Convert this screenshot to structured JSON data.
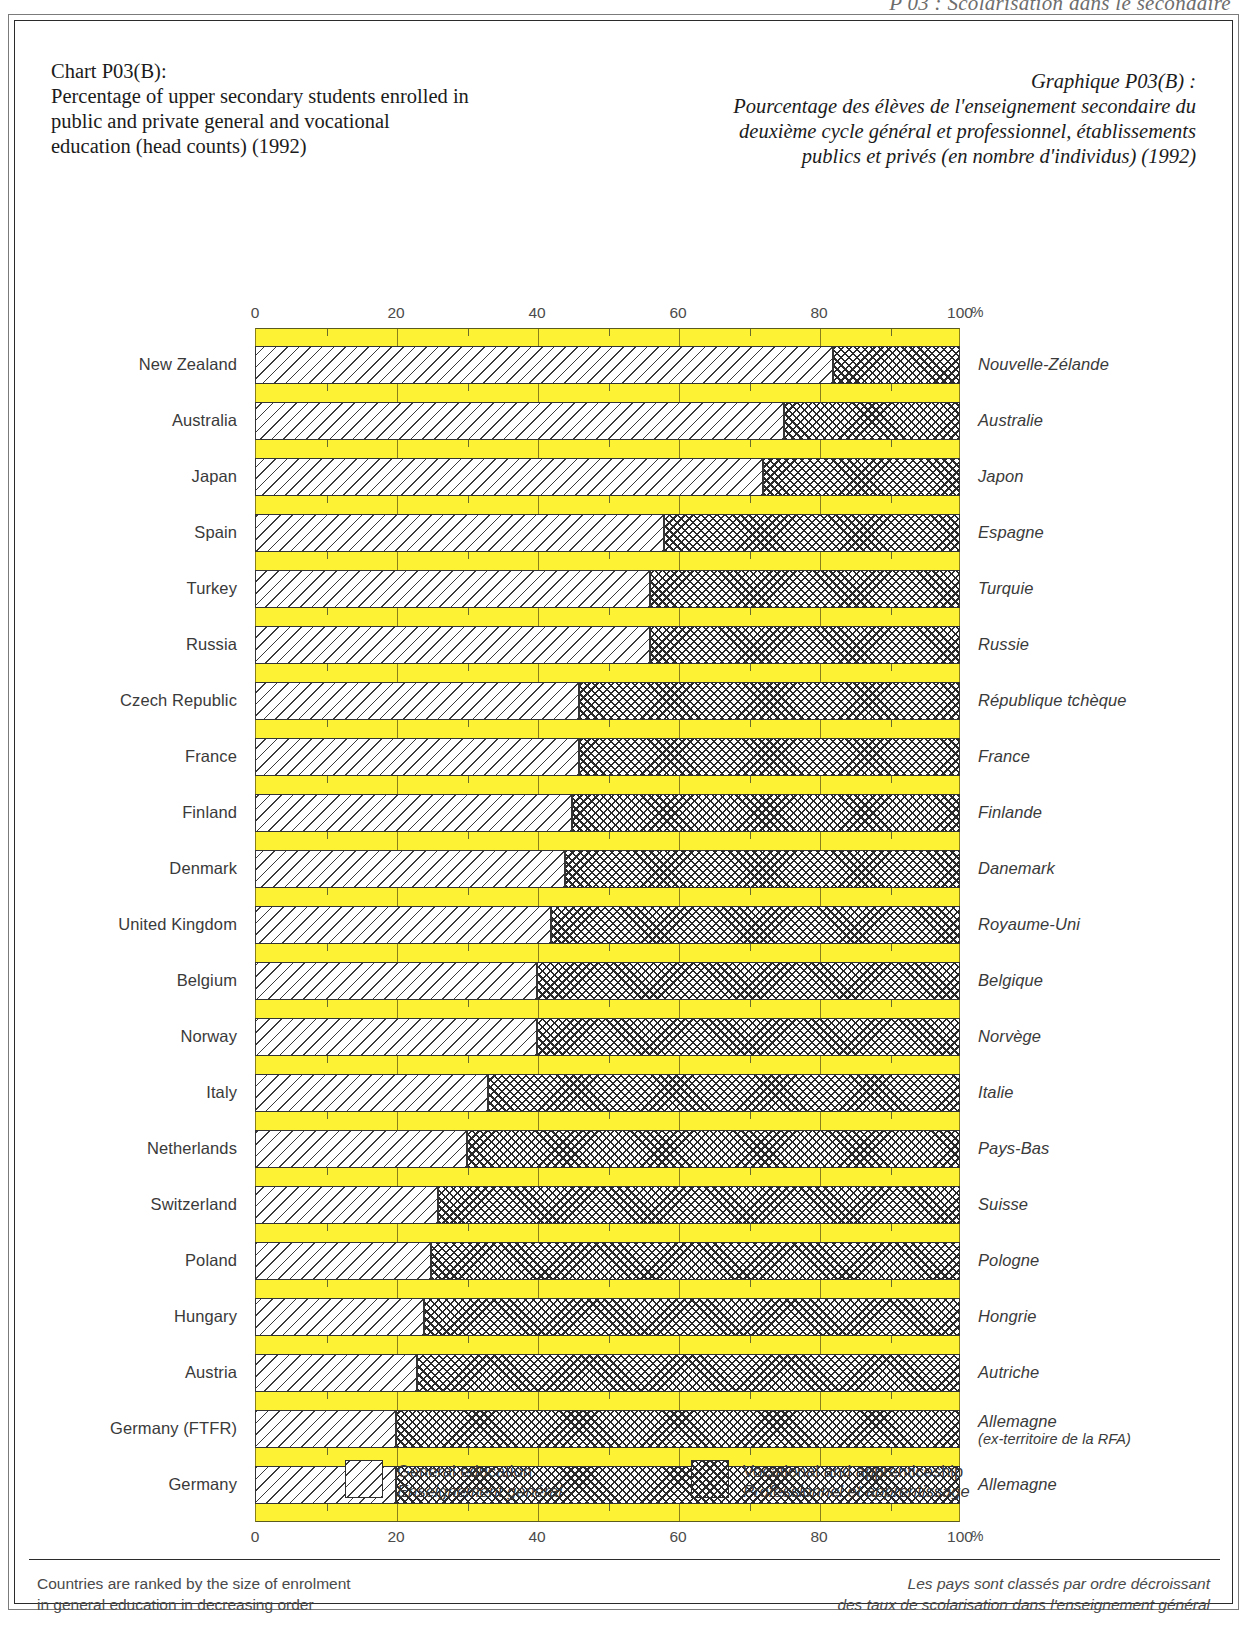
{
  "running_head": "P 03 : Scolarisation dans le secondaire",
  "title_en": "Chart P03(B):\nPercentage of upper secondary students enrolled in public and private general and vocational education (head counts) (1992)",
  "title_fr": "Graphique P03(B) :\nPourcentage des élèves de l'enseignement secondaire du deuxième cycle général et professionnel, établissements publics et privés (en nombre d'individus) (1992)",
  "axis": {
    "percent_symbol": "%",
    "ticks": [
      "0",
      "20",
      "40",
      "60",
      "80",
      "100"
    ]
  },
  "legend": {
    "general": {
      "label_en": "General education",
      "label_fr": "Enseignement général",
      "pattern": "diagonal-hatch"
    },
    "vocational": {
      "label_en": "Vocational and apprenticeship",
      "label_fr": "Professionnel et apprentissage",
      "pattern": "cross-hatch"
    }
  },
  "notes": {
    "en": "Countries are ranked by the size of enrolment\nin general education in decreasing order",
    "fr": "Les pays sont classés par ordre décroissant\ndes taux de scolarisation dans l'enseignement général"
  },
  "colors": {
    "band": "#FDF334",
    "band_border": "#8A7F18",
    "ink": "#3A3A3A"
  },
  "chart_data": {
    "type": "bar",
    "orientation": "horizontal",
    "stacked": true,
    "title_fr": "Graphique P03(B) : Pourcentage des élèves de l'enseignement secondaire du deuxième cycle général et professionnel, établissements publics et privés (en nombre d'individus) (1992)",
    "xlabel": "%",
    "ylabel": "",
    "xlim": [
      0,
      100
    ],
    "xticks": [
      0,
      20,
      40,
      60,
      80,
      100
    ],
    "grid": false,
    "legend_position": "bottom",
    "series": [
      {
        "name": "General education",
        "name_fr": "Enseignement général",
        "values": [
          82,
          75,
          72,
          58,
          56,
          56,
          46,
          46,
          45,
          44,
          42,
          40,
          40,
          33,
          30,
          26,
          25,
          24,
          23,
          20,
          20
        ]
      },
      {
        "name": "Vocational and apprenticeship",
        "name_fr": "Professionnel et apprentissage",
        "values": [
          18,
          25,
          28,
          42,
          44,
          44,
          54,
          54,
          55,
          56,
          58,
          60,
          60,
          67,
          70,
          74,
          75,
          76,
          77,
          80,
          80
        ]
      }
    ],
    "categories": [
      "New Zealand",
      "Australia",
      "Japan",
      "Spain",
      "Turkey",
      "Russia",
      "Czech Republic",
      "France",
      "Finland",
      "Denmark",
      "United Kingdom",
      "Belgium",
      "Norway",
      "Italy",
      "Netherlands",
      "Switzerland",
      "Poland",
      "Hungary",
      "Austria",
      "Germany (FTFR)",
      "Germany"
    ],
    "categories_fr": [
      "Nouvelle-Zélande",
      "Australie",
      "Japon",
      "Espagne",
      "Turquie",
      "Russie",
      "République tchèque",
      "France",
      "Finlande",
      "Danemark",
      "Royaume-Uni",
      "Belgique",
      "Norvège",
      "Italie",
      "Pays-Bas",
      "Suisse",
      "Pologne",
      "Hongrie",
      "Autriche",
      "Allemagne",
      "Allemagne"
    ]
  },
  "rows": [
    {
      "en": "New Zealand",
      "fr": "Nouvelle-Zélande",
      "fr_sub": "",
      "general": 82,
      "vocational": 18
    },
    {
      "en": "Australia",
      "fr": "Australie",
      "fr_sub": "",
      "general": 75,
      "vocational": 25
    },
    {
      "en": "Japan",
      "fr": "Japon",
      "fr_sub": "",
      "general": 72,
      "vocational": 28
    },
    {
      "en": "Spain",
      "fr": "Espagne",
      "fr_sub": "",
      "general": 58,
      "vocational": 42
    },
    {
      "en": "Turkey",
      "fr": "Turquie",
      "fr_sub": "",
      "general": 56,
      "vocational": 44
    },
    {
      "en": "Russia",
      "fr": "Russie",
      "fr_sub": "",
      "general": 56,
      "vocational": 44
    },
    {
      "en": "Czech Republic",
      "fr": "République tchèque",
      "fr_sub": "",
      "general": 46,
      "vocational": 54
    },
    {
      "en": "France",
      "fr": "France",
      "fr_sub": "",
      "general": 46,
      "vocational": 54
    },
    {
      "en": "Finland",
      "fr": "Finlande",
      "fr_sub": "",
      "general": 45,
      "vocational": 55
    },
    {
      "en": "Denmark",
      "fr": "Danemark",
      "fr_sub": "",
      "general": 44,
      "vocational": 56
    },
    {
      "en": "United Kingdom",
      "fr": "Royaume-Uni",
      "fr_sub": "",
      "general": 42,
      "vocational": 58
    },
    {
      "en": "Belgium",
      "fr": "Belgique",
      "fr_sub": "",
      "general": 40,
      "vocational": 60
    },
    {
      "en": "Norway",
      "fr": "Norvège",
      "fr_sub": "",
      "general": 40,
      "vocational": 60
    },
    {
      "en": "Italy",
      "fr": "Italie",
      "fr_sub": "",
      "general": 33,
      "vocational": 67
    },
    {
      "en": "Netherlands",
      "fr": "Pays-Bas",
      "fr_sub": "",
      "general": 30,
      "vocational": 70
    },
    {
      "en": "Switzerland",
      "fr": "Suisse",
      "fr_sub": "",
      "general": 26,
      "vocational": 74
    },
    {
      "en": "Poland",
      "fr": "Pologne",
      "fr_sub": "",
      "general": 25,
      "vocational": 75
    },
    {
      "en": "Hungary",
      "fr": "Hongrie",
      "fr_sub": "",
      "general": 24,
      "vocational": 76
    },
    {
      "en": "Austria",
      "fr": "Autriche",
      "fr_sub": "",
      "general": 23,
      "vocational": 77
    },
    {
      "en": "Germany (FTFR)",
      "fr": "Allemagne",
      "fr_sub": "(ex-territoire de la RFA)",
      "general": 20,
      "vocational": 80
    },
    {
      "en": "Germany",
      "fr": "Allemagne",
      "fr_sub": "",
      "general": 20,
      "vocational": 80
    }
  ]
}
